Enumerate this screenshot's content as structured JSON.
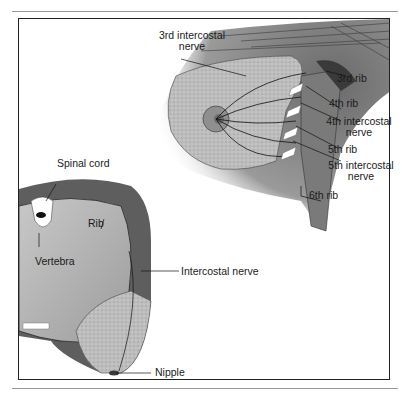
{
  "figure": {
    "colors": {
      "frame": "#222222",
      "tissue": "#b8b8b8",
      "muscle": "#6a6a6a",
      "lung": "#a9a9a9",
      "rule": "#9a9a9a"
    },
    "labels": {
      "third_intercostal_nerve": {
        "line1": "3rd intercostal",
        "line2": "nerve"
      },
      "third_rib": "3rd rib",
      "fourth_rib": "4th rib",
      "fourth_intercostal_nerve": {
        "line1": "4th intercostal",
        "line2": "nerve"
      },
      "fifth_rib": "5th rib",
      "fifth_intercostal_nerve": {
        "line1": "5th intercostal",
        "line2": "nerve"
      },
      "sixth_rib": "6th rib",
      "spinal_cord": "Spinal cord",
      "rib": "Rib",
      "vertebra": "Vertebra",
      "intercostal_nerve": "Intercostal nerve",
      "nipple": "Nipple"
    }
  }
}
